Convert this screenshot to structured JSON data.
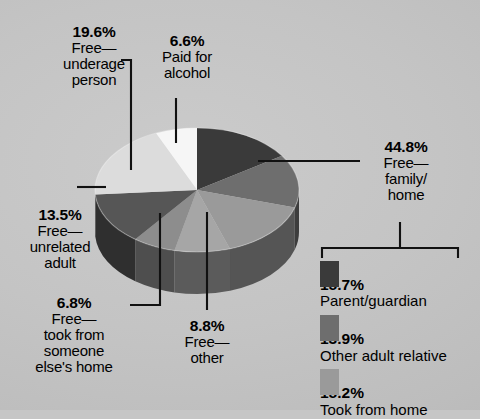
{
  "chart_data": {
    "type": "pie",
    "title": "",
    "style": "3d-pie",
    "units": "percent",
    "categories": [
      "Free — family/home",
      "Free — other",
      "Free — took from someone else's home",
      "Free — unrelated adult",
      "Free — underage person",
      "Paid for alcohol"
    ],
    "values": [
      44.8,
      8.8,
      6.8,
      13.5,
      19.6,
      6.6
    ],
    "slices": [
      {
        "label": "Free — family/home",
        "value": 44.8,
        "color": "#3b3b3b",
        "start_deg": 0,
        "sweep_deg": 161.3
      },
      {
        "label": "Free — other",
        "value": 8.8,
        "color": "#a9a9a9",
        "start_deg": 161.3,
        "sweep_deg": 31.7
      },
      {
        "label": "Free — took from someone else's home",
        "value": 6.8,
        "color": "#8e8e8e",
        "start_deg": 193.0,
        "sweep_deg": 24.5
      },
      {
        "label": "Free — unrelated adult",
        "value": 13.5,
        "color": "#565656",
        "start_deg": 217.5,
        "sweep_deg": 48.6
      },
      {
        "label": "Free — underage person",
        "value": 19.6,
        "color": "#d9d9d9",
        "start_deg": 266.1,
        "sweep_deg": 70.6
      },
      {
        "label": "Paid for alcohol",
        "value": 6.6,
        "color": "#f4f4f4",
        "start_deg": 336.7,
        "sweep_deg": 23.3
      }
    ],
    "breakdown": {
      "of": "Free — family/home",
      "total": 44.8,
      "items": [
        {
          "percent": "15.7%",
          "name": "Parent/guardian",
          "color": "#3a3a3a"
        },
        {
          "percent": "13.9%",
          "name": "Other adult relative",
          "color": "#6e6e6e"
        },
        {
          "percent": "15.2%",
          "name": "Took from home",
          "color": "#9a9a9a"
        }
      ]
    },
    "legend_position": "bottom-right",
    "grid": false
  },
  "labels": {
    "underage": {
      "pct": "19.6%",
      "l1": "Free—",
      "l2": "underage",
      "l3": "person"
    },
    "paid": {
      "pct": "6.6%",
      "l1": "Paid for",
      "l2": "alcohol"
    },
    "family": {
      "pct": "44.8%",
      "l1": "Free—",
      "l2": "family/",
      "l3": "home"
    },
    "unrelated": {
      "pct": "13.5%",
      "l1": "Free—",
      "l2": "unrelated",
      "l3": "adult"
    },
    "tookfrom": {
      "pct": "6.8%",
      "l1": "Free—",
      "l2": "took from",
      "l3": "someone",
      "l4": "else's home"
    },
    "other": {
      "pct": "8.8%",
      "l1": "Free—",
      "l2": "other"
    }
  },
  "legend": {
    "items": [
      {
        "pct": "15.7%",
        "name": "Parent/guardian",
        "color": "#3a3a3a"
      },
      {
        "pct": "13.9%",
        "name": "Other adult relative",
        "color": "#6e6e6e"
      },
      {
        "pct": "15.2%",
        "name": "Took from home",
        "color": "#9a9a9a"
      }
    ]
  },
  "colors": {
    "background": "#c4c4c4",
    "leader_line": "#000000",
    "text": "#000000"
  }
}
